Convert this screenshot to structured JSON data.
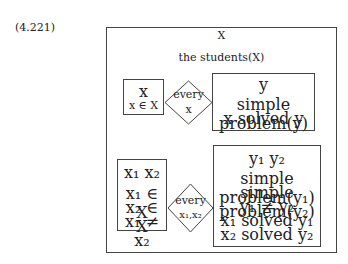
{
  "equation_number": "(4.221)",
  "drs": {
    "universe": "X",
    "conditions": [
      "the students(X)"
    ],
    "implications": [
      {
        "antecedent": {
          "universe": "x",
          "conditions": [
            "x ∈ X"
          ]
        },
        "quantifier": {
          "label": "every",
          "variable": "x"
        },
        "consequent": {
          "universe": "y",
          "conditions": [
            "simple problem(y)",
            "x solved y"
          ]
        }
      },
      {
        "antecedent": {
          "universe": "x₁ x₂",
          "conditions": [
            "x₁ ∈ X",
            "x₂ ∈ X",
            "x₁ ≠ x₂"
          ]
        },
        "quantifier": {
          "label": "every",
          "variable": "x₁,x₂"
        },
        "consequent": {
          "universe": "y₁  y₂",
          "conditions": [
            "simple problem(y₁)",
            "simple problem(y₂)",
            "y₁ ≠ y₂",
            "x₁ solved y₁",
            "x₂ solved y₂"
          ]
        }
      }
    ]
  }
}
